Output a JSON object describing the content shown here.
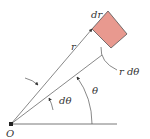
{
  "diagram": {
    "colors": {
      "element_fill": "#e8998f",
      "element_stroke": "#555555",
      "line": "#555555",
      "text": "#333333"
    },
    "labels": {
      "origin": "O",
      "radius": "r",
      "dr": "dr",
      "arc_length": "r dθ",
      "dtheta": "dθ",
      "theta": "θ"
    }
  }
}
